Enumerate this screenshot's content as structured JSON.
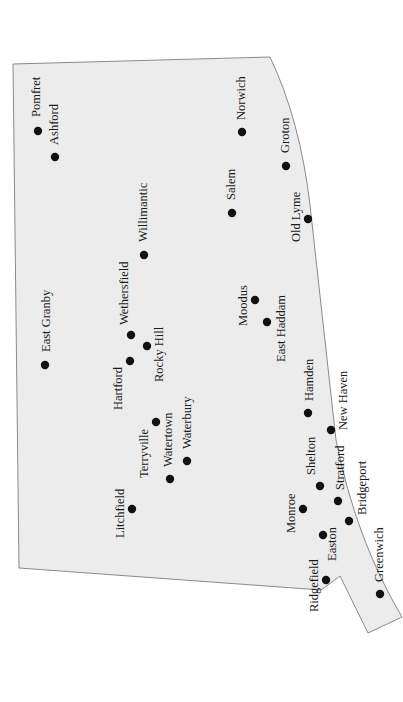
{
  "map": {
    "region": "Connecticut",
    "orientation": "rotated 90 degrees clockwise; labels read bottom-to-top",
    "colors": {
      "land": "#ececec",
      "outline": "#8a8a8a",
      "marker": "#111111",
      "background": "#ffffff"
    },
    "towns": [
      {
        "name": "Pomfret",
        "x": 38,
        "y": 131,
        "lx": 40,
        "ly": 117
      },
      {
        "name": "Ashford",
        "x": 55,
        "y": 157,
        "lx": 58,
        "ly": 145
      },
      {
        "name": "Norwich",
        "x": 242,
        "y": 132,
        "lx": 245,
        "ly": 120
      },
      {
        "name": "Groton",
        "x": 286,
        "y": 166,
        "lx": 289,
        "ly": 153
      },
      {
        "name": "Salem",
        "x": 232,
        "y": 213,
        "lx": 235,
        "ly": 200
      },
      {
        "name": "Old Lyme",
        "x": 308,
        "y": 219,
        "lx": 300,
        "ly": 242
      },
      {
        "name": "Willimantic",
        "x": 144,
        "y": 255,
        "lx": 147,
        "ly": 242
      },
      {
        "name": "East Granby",
        "x": 45,
        "y": 365,
        "lx": 50,
        "ly": 352
      },
      {
        "name": "Wethersfield",
        "x": 131,
        "y": 335,
        "lx": 128,
        "ly": 325
      },
      {
        "name": "Rocky Hill",
        "x": 147,
        "y": 346,
        "lx": 163,
        "ly": 382
      },
      {
        "name": "Hartford",
        "x": 130,
        "y": 361,
        "lx": 122,
        "ly": 410
      },
      {
        "name": "Moodus",
        "x": 255,
        "y": 300,
        "lx": 247,
        "ly": 326
      },
      {
        "name": "East Haddam",
        "x": 267,
        "y": 322,
        "lx": 285,
        "ly": 362
      },
      {
        "name": "Hamden",
        "x": 308,
        "y": 413,
        "lx": 313,
        "ly": 401
      },
      {
        "name": "New Haven",
        "x": 331,
        "y": 430,
        "lx": 347,
        "ly": 430
      },
      {
        "name": "Terryville",
        "x": 156,
        "y": 422,
        "lx": 148,
        "ly": 478
      },
      {
        "name": "Watertown",
        "x": 170,
        "y": 479,
        "lx": 172,
        "ly": 467
      },
      {
        "name": "Waterbury",
        "x": 187,
        "y": 461,
        "lx": 191,
        "ly": 449
      },
      {
        "name": "Litchfield",
        "x": 132,
        "y": 509,
        "lx": 124,
        "ly": 538
      },
      {
        "name": "Shelton",
        "x": 320,
        "y": 486,
        "lx": 315,
        "ly": 475
      },
      {
        "name": "Stratford",
        "x": 338,
        "y": 501,
        "lx": 344,
        "ly": 490
      },
      {
        "name": "Monroe",
        "x": 303,
        "y": 509,
        "lx": 295,
        "ly": 533
      },
      {
        "name": "Bridgeport",
        "x": 349,
        "y": 521,
        "lx": 366,
        "ly": 515
      },
      {
        "name": "Easton",
        "x": 323,
        "y": 535,
        "lx": 336,
        "ly": 561
      },
      {
        "name": "Ridgefield",
        "x": 326,
        "y": 580,
        "lx": 318,
        "ly": 612
      },
      {
        "name": "Greenwich",
        "x": 380,
        "y": 594,
        "lx": 383,
        "ly": 582
      }
    ]
  }
}
